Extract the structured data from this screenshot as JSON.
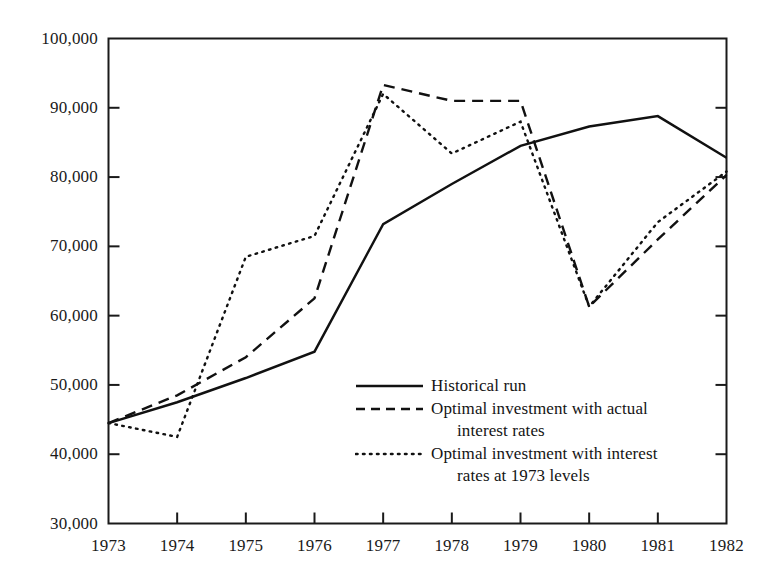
{
  "chart_data": {
    "type": "line",
    "title": "",
    "xlabel": "",
    "ylabel": "",
    "categories": [
      "1973",
      "1974",
      "1975",
      "1976",
      "1977",
      "1978",
      "1979",
      "1980",
      "1981",
      "1982"
    ],
    "x": [
      1973,
      1974,
      1975,
      1976,
      1977,
      1978,
      1979,
      1980,
      1981,
      1982
    ],
    "xlim": [
      1973,
      1982
    ],
    "ylim": [
      30000,
      100000
    ],
    "y_ticks": [
      30000,
      40000,
      50000,
      60000,
      70000,
      80000,
      90000,
      100000
    ],
    "y_tick_labels": [
      "30,000",
      "40,000",
      "50,000",
      "60,000",
      "70,000",
      "80,000",
      "90,000",
      "100,000"
    ],
    "grid": false,
    "legend_position": "inside-lower-right",
    "series": [
      {
        "name": "Historical run",
        "style": "solid",
        "color": "#111111",
        "values": [
          44500,
          47500,
          51000,
          54800,
          73200,
          79000,
          84500,
          87300,
          88800,
          82800
        ]
      },
      {
        "name": "Optimal investment with actual interest rates",
        "style": "dashed",
        "color": "#111111",
        "values": [
          44500,
          48500,
          54000,
          62500,
          93300,
          91000,
          91000,
          61300,
          71000,
          80300
        ]
      },
      {
        "name": "Optimal investment with interest rates at 1973 levels",
        "style": "dotted",
        "color": "#111111",
        "values": [
          44500,
          42500,
          68500,
          71500,
          92000,
          83400,
          88000,
          61300,
          73500,
          80800
        ]
      }
    ]
  },
  "axis": {
    "y_labels": [
      "100,000",
      "90,000",
      "80,000",
      "70,000",
      "60,000",
      "50,000",
      "40,000",
      "30,000"
    ],
    "x_labels": [
      "1973",
      "1974",
      "1975",
      "1976",
      "1977",
      "1978",
      "1979",
      "1980",
      "1981",
      "1982"
    ]
  },
  "legend": {
    "items": [
      {
        "style": "solid",
        "line1": "Historical run",
        "line2": ""
      },
      {
        "style": "dashed",
        "line1": "Optimal investment with actual",
        "line2": "interest rates"
      },
      {
        "style": "dotted",
        "line1": "Optimal investment with interest",
        "line2": "rates at 1973 levels"
      }
    ]
  }
}
